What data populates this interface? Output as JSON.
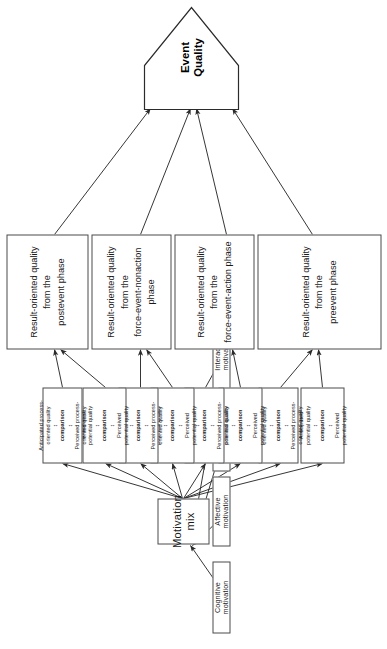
{
  "figure": {
    "orientation": "rotated-90-ccw"
  },
  "colors": {
    "stroke": "#4a4a4a",
    "edge": "#2b2b2b",
    "text": "#1a1a1a",
    "background": "#ffffff"
  },
  "motivations": {
    "items": [
      {
        "label": "Cognitive motivation"
      },
      {
        "label": "Affective motivation"
      },
      {
        "label": "Integrative motivation"
      },
      {
        "label": "Interactive motivation"
      }
    ]
  },
  "mix": {
    "label": "Motivation mix"
  },
  "comparisons": {
    "potential": {
      "line1": "Anticipated",
      "line2": "potential  quality",
      "arrow_down": "↕",
      "cmp": "comparison",
      "line3": "Perceived",
      "line4": "potential quality"
    },
    "process": {
      "line1": "Anticipated process-",
      "line2": "oriented quality",
      "arrow_down": "↕",
      "cmp": "comparison",
      "line3": "Perceived process-",
      "line4": "oriented quality"
    },
    "order": [
      "potential",
      "process",
      "potential",
      "process",
      "potential",
      "process",
      "potential",
      "process"
    ]
  },
  "phases": {
    "items": [
      {
        "line1": "Result-oriented quality",
        "line2": "from the",
        "line3": "preevent phase"
      },
      {
        "line1": "Result-oriented quality",
        "line2": "from the",
        "line3": "force-event-action phase"
      },
      {
        "line1": "Result-oriented quality",
        "line2": "from the",
        "line3": "force-event-nonaction phase"
      },
      {
        "line1": "Result-oriented quality",
        "line2": "from the",
        "line3": "postevent phase"
      }
    ]
  },
  "outcome": {
    "line1": "Event",
    "line2": "Quality"
  }
}
